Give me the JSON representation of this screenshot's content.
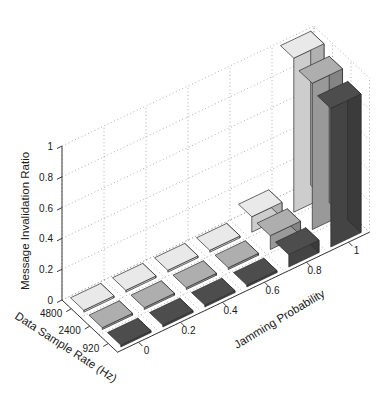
{
  "chart_data": {
    "type": "bar",
    "title": "",
    "subtitle": "",
    "projection": "3d",
    "xlabel": "Data Sample Rate (Hz)",
    "ylabel": "Jamming Probability",
    "zlabel": "Message Invalidation Ratio",
    "x_categories": [
      "4800",
      "2400",
      "920"
    ],
    "y_categories": [
      "0",
      "0.2",
      "0.4",
      "0.6",
      "0.8",
      "1"
    ],
    "z_ticks": [
      "0",
      "0.2",
      "0.4",
      "0.6",
      "0.8",
      "1"
    ],
    "zlim": [
      0,
      1
    ],
    "grid": true,
    "legend": "none",
    "series": [
      {
        "name": "4800",
        "color": "#e9e9e9",
        "values": [
          0,
          0,
          0,
          0,
          0.1,
          1.0
        ]
      },
      {
        "name": "2400",
        "color": "#aeaeae",
        "values": [
          0,
          0,
          0,
          0,
          0.09,
          0.95
        ]
      },
      {
        "name": "920",
        "color": "#4d4d4d",
        "values": [
          0,
          0,
          0,
          0,
          0.08,
          0.9
        ]
      }
    ],
    "annotations": []
  },
  "axes": {
    "z_axis_title": "Message Invalidation Ratio",
    "x_axis_title": "Data Sample Rate (Hz)",
    "y_axis_title": "Jamming Probability",
    "z_tick_labels": [
      "1",
      "0.8",
      "0.6",
      "0.4",
      "0.2",
      "0"
    ],
    "x_tick_labels": [
      "4800",
      "2400",
      "920"
    ],
    "y_tick_labels": [
      "0",
      "0.2",
      "0.4",
      "0.6",
      "0.8",
      "1"
    ]
  },
  "colors": {
    "series_light": "#e9e9e9",
    "series_medium": "#aeaeae",
    "series_dark": "#4d4d4d",
    "axis": "#3a3a3a",
    "grid": "#9a9a9a",
    "background": "#ffffff",
    "edge": "#2b2b2b"
  }
}
